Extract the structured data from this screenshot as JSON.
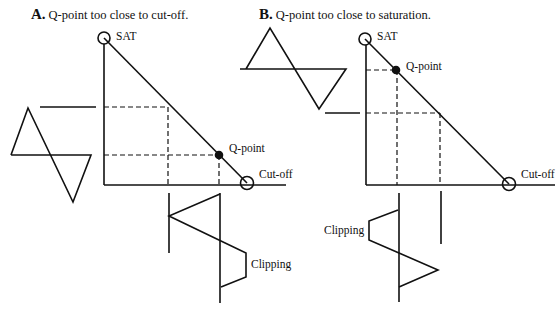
{
  "panels": [
    {
      "id": "A",
      "letter": "A.",
      "title": "Q-point too close to cut-off.",
      "labels": {
        "saturation": "SAT",
        "qpoint": "Q-point",
        "cutoff": "Cut-off",
        "clipping": "Clipping"
      }
    },
    {
      "id": "B",
      "letter": "B.",
      "title": "Q-point too close to saturation.",
      "labels": {
        "saturation": "SAT",
        "qpoint": "Q-point",
        "cutoff": "Cut-off",
        "clipping": "Clipping"
      }
    }
  ],
  "colors": {
    "stroke": "#111111",
    "background": "#ffffff"
  }
}
